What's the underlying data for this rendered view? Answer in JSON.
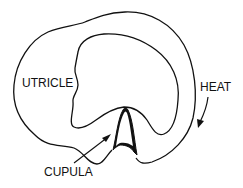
{
  "diagram": {
    "labels": {
      "utricle": "UTRICLE",
      "heat": "HEAT",
      "cupula": "CUPULA"
    },
    "colors": {
      "stroke": "#111111",
      "background": "#ffffff"
    },
    "elements": [
      {
        "name": "outer-canal-wall",
        "type": "closed-curve"
      },
      {
        "name": "inner-canal-wall",
        "type": "closed-curve"
      },
      {
        "name": "cupula",
        "type": "thick-arch"
      },
      {
        "name": "cupula-pointer-arrow",
        "type": "arrow",
        "points_to": "cupula"
      },
      {
        "name": "heat-flow-arrow",
        "type": "curved-arrow",
        "direction": "clockwise-down"
      }
    ]
  }
}
